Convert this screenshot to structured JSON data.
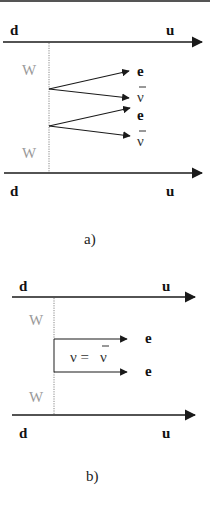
{
  "colors": {
    "line": "#1a1a1a",
    "w_label": "#9a9a9a",
    "w_line": "#888888",
    "border": "#555555"
  },
  "diagram_a": {
    "caption": "a)",
    "top_line": {
      "left_label": "d",
      "right_label": "u"
    },
    "bottom_line": {
      "left_label": "d",
      "right_label": "u"
    },
    "upper_w_label": "W",
    "lower_w_label": "W",
    "upper_vertex_outputs": [
      {
        "label": "e",
        "bar": false
      },
      {
        "label": "ν",
        "bar": true
      }
    ],
    "lower_vertex_outputs": [
      {
        "label": "e",
        "bar": false
      },
      {
        "label": "ν",
        "bar": true
      }
    ]
  },
  "diagram_b": {
    "caption": "b)",
    "top_line": {
      "left_label": "d",
      "right_label": "u"
    },
    "bottom_line": {
      "left_label": "d",
      "right_label": "u"
    },
    "upper_w_label": "W",
    "lower_w_label": "W",
    "outputs": [
      {
        "label": "e"
      },
      {
        "label": "e"
      }
    ],
    "majorana_label_left": "ν =",
    "majorana_label_right": "ν"
  }
}
